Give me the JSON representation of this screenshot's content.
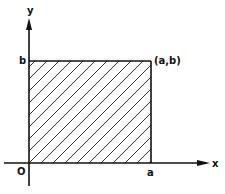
{
  "diagram": {
    "title": "",
    "axes": {
      "x_label": "x",
      "y_label": "y",
      "origin_label": "O"
    },
    "region": {
      "description": "hatched rectangle 0<=x<=a, 0<=y<=b",
      "corner_label": "(a,b)",
      "x_tick_label": "a",
      "y_tick_label": "b",
      "fill": "diagonal hatch"
    },
    "colors": {
      "stroke": "#111111",
      "background": "#ffffff"
    }
  }
}
